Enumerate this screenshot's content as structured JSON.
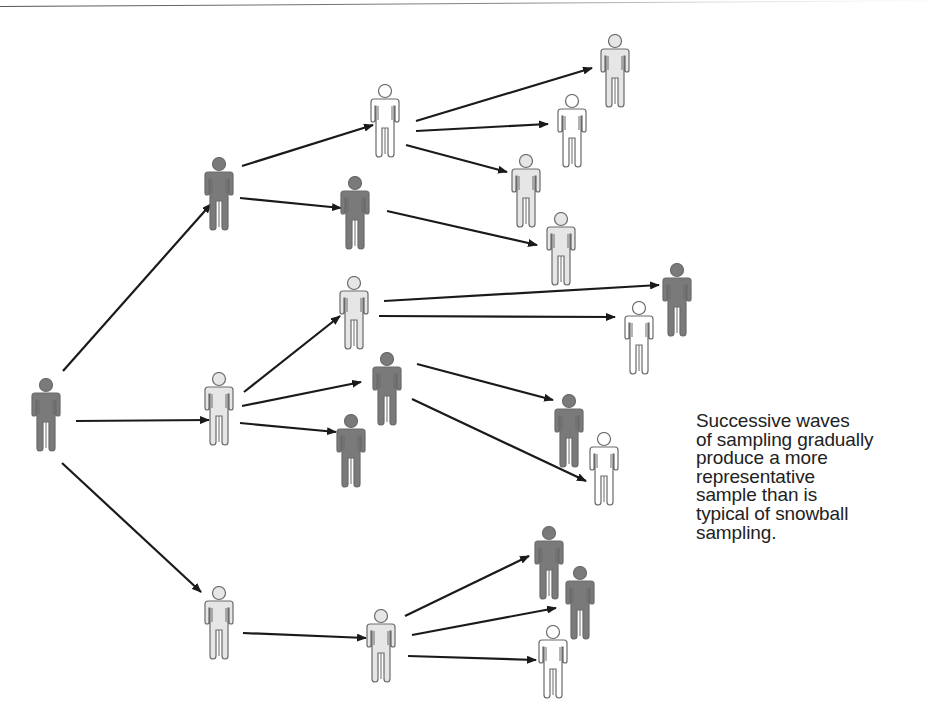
{
  "colors": {
    "dark": "#7a7a7a",
    "medium": "#c9c9c9",
    "light": "#e6e6e6",
    "white": "#ffffff",
    "outline": "#6a6a6a",
    "arrow": "#1a1a1a"
  },
  "caption": {
    "lines": [
      "Successive waves",
      "of sampling gradually",
      "produce a more",
      "representative",
      "sample than is",
      "typical of snowball",
      "sampling."
    ]
  },
  "people": [
    {
      "id": "seed",
      "x": 46,
      "y": 378,
      "fill": "dark"
    },
    {
      "id": "w1a",
      "x": 219,
      "y": 157,
      "fill": "dark"
    },
    {
      "id": "w1b",
      "x": 219,
      "y": 372,
      "fill": "light"
    },
    {
      "id": "w1c",
      "x": 219,
      "y": 586,
      "fill": "light"
    },
    {
      "id": "w2a",
      "x": 385,
      "y": 84,
      "fill": "white"
    },
    {
      "id": "w2b",
      "x": 355,
      "y": 176,
      "fill": "dark"
    },
    {
      "id": "w2c",
      "x": 354,
      "y": 276,
      "fill": "light"
    },
    {
      "id": "w2d",
      "x": 387,
      "y": 352,
      "fill": "dark"
    },
    {
      "id": "w2e",
      "x": 351,
      "y": 414,
      "fill": "dark"
    },
    {
      "id": "w2f",
      "x": 381,
      "y": 609,
      "fill": "light"
    },
    {
      "id": "w3a",
      "x": 615,
      "y": 34,
      "fill": "light"
    },
    {
      "id": "w3b",
      "x": 572,
      "y": 94,
      "fill": "white"
    },
    {
      "id": "w3c",
      "x": 526,
      "y": 154,
      "fill": "light"
    },
    {
      "id": "w3d",
      "x": 561,
      "y": 212,
      "fill": "light"
    },
    {
      "id": "w3e",
      "x": 677,
      "y": 263,
      "fill": "dark"
    },
    {
      "id": "w3f",
      "x": 639,
      "y": 301,
      "fill": "white"
    },
    {
      "id": "w3g",
      "x": 569,
      "y": 394,
      "fill": "dark"
    },
    {
      "id": "w3h",
      "x": 604,
      "y": 432,
      "fill": "white"
    },
    {
      "id": "w3i",
      "x": 549,
      "y": 526,
      "fill": "dark"
    },
    {
      "id": "w3j",
      "x": 580,
      "y": 566,
      "fill": "dark"
    },
    {
      "id": "w3k",
      "x": 553,
      "y": 625,
      "fill": "white"
    }
  ],
  "arrows": [
    {
      "x1": 63,
      "y1": 371,
      "x2": 211,
      "y2": 204
    },
    {
      "x1": 76,
      "y1": 421,
      "x2": 209,
      "y2": 420
    },
    {
      "x1": 62,
      "y1": 463,
      "x2": 201,
      "y2": 592
    },
    {
      "x1": 242,
      "y1": 166,
      "x2": 373,
      "y2": 125
    },
    {
      "x1": 240,
      "y1": 198,
      "x2": 341,
      "y2": 208
    },
    {
      "x1": 244,
      "y1": 392,
      "x2": 340,
      "y2": 316
    },
    {
      "x1": 242,
      "y1": 406,
      "x2": 361,
      "y2": 382
    },
    {
      "x1": 240,
      "y1": 423,
      "x2": 336,
      "y2": 432
    },
    {
      "x1": 243,
      "y1": 633,
      "x2": 366,
      "y2": 638
    },
    {
      "x1": 416,
      "y1": 121,
      "x2": 592,
      "y2": 68
    },
    {
      "x1": 416,
      "y1": 131,
      "x2": 548,
      "y2": 124
    },
    {
      "x1": 406,
      "y1": 145,
      "x2": 507,
      "y2": 172
    },
    {
      "x1": 387,
      "y1": 211,
      "x2": 537,
      "y2": 245
    },
    {
      "x1": 384,
      "y1": 301,
      "x2": 659,
      "y2": 285
    },
    {
      "x1": 379,
      "y1": 316,
      "x2": 615,
      "y2": 317
    },
    {
      "x1": 417,
      "y1": 364,
      "x2": 553,
      "y2": 400
    },
    {
      "x1": 412,
      "y1": 399,
      "x2": 586,
      "y2": 481
    },
    {
      "x1": 405,
      "y1": 616,
      "x2": 529,
      "y2": 556
    },
    {
      "x1": 412,
      "y1": 635,
      "x2": 556,
      "y2": 608
    },
    {
      "x1": 408,
      "y1": 656,
      "x2": 536,
      "y2": 660
    }
  ]
}
